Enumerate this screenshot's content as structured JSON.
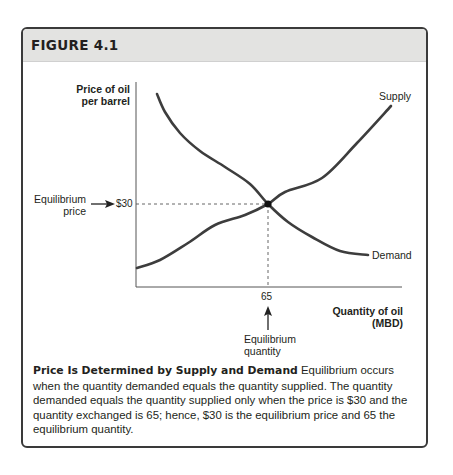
{
  "figure": {
    "title": "FIGURE 4.1"
  },
  "chart_data": {
    "type": "line",
    "title": "Price Is Determined by Supply and Demand",
    "xlabel": "Quantity of oil (MBD)",
    "ylabel": "Price of oil per barrel",
    "x_ticks": [
      "65"
    ],
    "y_ticks": [
      "$30"
    ],
    "grid": false,
    "legend": "inline labels",
    "series": [
      {
        "name": "Supply",
        "points_px": [
          [
            137,
            268
          ],
          [
            160,
            260
          ],
          [
            188,
            243
          ],
          [
            215,
            225
          ],
          [
            245,
            215
          ],
          [
            268,
            204
          ],
          [
            285,
            192
          ],
          [
            322,
            178
          ],
          [
            357,
            143
          ],
          [
            391,
            106
          ]
        ]
      },
      {
        "name": "Demand",
        "points_px": [
          [
            157,
            94
          ],
          [
            165,
            112
          ],
          [
            180,
            133
          ],
          [
            200,
            151
          ],
          [
            225,
            167
          ],
          [
            250,
            184
          ],
          [
            268,
            204
          ],
          [
            288,
            222
          ],
          [
            312,
            237
          ],
          [
            340,
            251
          ],
          [
            368,
            255
          ]
        ]
      }
    ],
    "equilibrium": {
      "price": 30,
      "quantity": 65,
      "price_label": "$30",
      "quantity_label": "65"
    },
    "annotations": [
      "Equilibrium price",
      "Equilibrium quantity"
    ]
  },
  "labels": {
    "y_axis_line1": "Price of oil",
    "y_axis_line2": "per barrel",
    "x_axis_line1": "Quantity of oil",
    "x_axis_line2": "(MBD)",
    "supply": "Supply",
    "demand": "Demand",
    "price_tick": "$30",
    "quantity_tick": "65",
    "eq_price_line1": "Equilibrium",
    "eq_price_line2": "price",
    "eq_qty_line1": "Equilibrium",
    "eq_qty_line2": "quantity"
  },
  "caption": {
    "title": "Price Is Determined by Supply and Demand",
    "body": " Equilibrium occurs when the quantity demanded equals the quantity supplied. The quantity demanded equals the quantity supplied only when the price is $30 and the quantity exchanged is 65; hence, $30 is the equilibrium price and 65 the equilibrium quantity."
  },
  "colors": {
    "header_bg": "#e3e3e1",
    "border": "#3a3a3a",
    "curve": "#3d3d3d"
  }
}
